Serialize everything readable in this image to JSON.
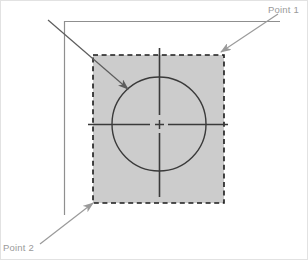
{
  "figure": {
    "width": 308,
    "height": 260,
    "background_color": "#ffffff",
    "border_color": "#e2e2e2"
  },
  "colors": {
    "fill_gray": "#cccccc",
    "dashed_outline": "#1a1a1a",
    "circle_stroke": "#3a3a3a",
    "crosshair": "#3a3a3a",
    "corner_lines": "#8f8f8f",
    "leader_lines": "#9a9a9a",
    "diagonal_arrow": "#6e6e6e",
    "label_text": "#9a9a9a"
  },
  "labels": {
    "point1": "Point 1",
    "point2": "Point 2"
  },
  "shapes": {
    "region": {
      "name": "dashed-gray-square",
      "x": 93,
      "y": 55,
      "width": 131,
      "height": 148,
      "fill": "#cccccc",
      "stroke_style": "dashed"
    },
    "circle": {
      "name": "circle",
      "cx": 159,
      "cy": 124,
      "r": 47
    },
    "crosshair": {
      "cx": 159,
      "cy": 124,
      "h_start_x": 88,
      "h_end_x": 228,
      "v_start_y": 48,
      "v_end_y": 197,
      "center_gap": 9,
      "center_mark_size": 7
    },
    "corner_lines": {
      "vertical_x": 64,
      "vertical_y1": 21,
      "vertical_y2": 215,
      "horizontal_y": 21,
      "horizontal_x1": 64,
      "horizontal_x2": 280
    }
  },
  "leaders": {
    "point1": {
      "from_x": 278,
      "from_y": 14,
      "to_x": 221,
      "to_y": 52,
      "label_x": 268,
      "label_y": 13
    },
    "point2": {
      "from_x": 40,
      "from_y": 244,
      "to_x": 93,
      "to_y": 203,
      "label_x": 3,
      "label_y": 251
    },
    "diagonal": {
      "from_x": 48,
      "from_y": 20,
      "to_x": 128,
      "to_y": 89
    }
  }
}
